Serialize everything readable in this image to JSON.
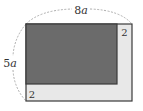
{
  "diagram": {
    "type": "geometry-figure",
    "labels": {
      "width": "8a",
      "width_num": "8",
      "width_var": "a",
      "height": "5a",
      "height_num": "5",
      "height_var": "a",
      "strip_right": "2",
      "strip_bottom": "2"
    },
    "colors": {
      "outer_fill": "#e8e8e8",
      "inner_fill": "#6b6b6b",
      "stroke": "#3a3a3a",
      "dashed_arc": "#9a9a9a",
      "background": "#ffffff"
    },
    "shapes": {
      "outer_rect": {
        "x": 26,
        "y": 24,
        "w": 106,
        "h": 77
      },
      "inner_rect": {
        "x": 26,
        "y": 24,
        "w": 91,
        "h": 60
      }
    }
  }
}
